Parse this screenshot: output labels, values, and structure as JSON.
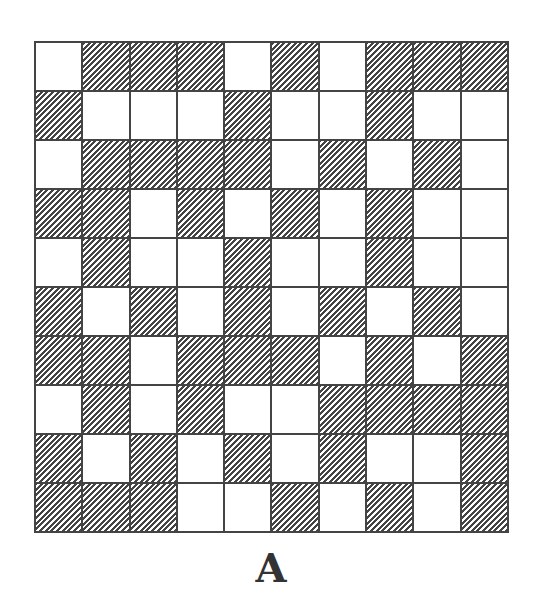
{
  "figure": {
    "label": "A",
    "rows": 10,
    "cols": 10,
    "colors": {
      "line": "#444444",
      "white": "#ffffff",
      "hatch": "#444444"
    },
    "legend": {
      "H": "hatched cell",
      "W": "white cell"
    },
    "grid": [
      [
        "W",
        "H",
        "H",
        "H",
        "W",
        "H",
        "W",
        "H",
        "H",
        "H"
      ],
      [
        "H",
        "W",
        "W",
        "W",
        "H",
        "W",
        "W",
        "H",
        "W",
        "W"
      ],
      [
        "W",
        "H",
        "H",
        "H",
        "H",
        "W",
        "H",
        "W",
        "H",
        "W"
      ],
      [
        "H",
        "H",
        "W",
        "H",
        "W",
        "H",
        "W",
        "H",
        "W",
        "W"
      ],
      [
        "W",
        "H",
        "W",
        "W",
        "H",
        "W",
        "W",
        "H",
        "W",
        "W"
      ],
      [
        "H",
        "W",
        "H",
        "W",
        "H",
        "W",
        "H",
        "W",
        "H",
        "W"
      ],
      [
        "H",
        "H",
        "W",
        "H",
        "H",
        "H",
        "W",
        "H",
        "W",
        "H"
      ],
      [
        "W",
        "H",
        "W",
        "H",
        "W",
        "W",
        "H",
        "H",
        "H",
        "H"
      ],
      [
        "H",
        "W",
        "H",
        "W",
        "H",
        "W",
        "H",
        "W",
        "W",
        "H"
      ],
      [
        "H",
        "H",
        "H",
        "W",
        "W",
        "H",
        "W",
        "H",
        "W",
        "H"
      ]
    ]
  }
}
